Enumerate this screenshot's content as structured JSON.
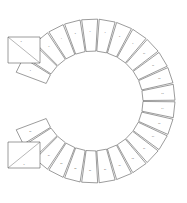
{
  "drawing": {
    "title": "C-Ring Segmented Assembly",
    "background_color": "#ffffff",
    "line_color": "#4a4a4a",
    "secondary_line_color": "#6e6e6e",
    "mark_color": "#6b6b6b",
    "canvas": {
      "width": 187,
      "height": 203
    }
  },
  "ring": {
    "center_x": 93,
    "center_y": 101,
    "inner_radius": 50,
    "outer_radius": 82,
    "segment_count": 26,
    "gap_opening_side": "left",
    "gap_start_angle_deg": 160,
    "gap_end_angle_deg": 200,
    "segments": [
      {
        "index": 1,
        "mark": "1",
        "start_deg": 200,
        "end_deg": 212.3
      },
      {
        "index": 2,
        "mark": "2",
        "start_deg": 212.3,
        "end_deg": 224.6
      },
      {
        "index": 3,
        "mark": "3",
        "start_deg": 224.6,
        "end_deg": 236.9
      },
      {
        "index": 4,
        "mark": "4",
        "start_deg": 236.9,
        "end_deg": 249.2
      },
      {
        "index": 5,
        "mark": "5",
        "start_deg": 249.2,
        "end_deg": 261.5
      },
      {
        "index": 6,
        "mark": "6",
        "start_deg": 261.5,
        "end_deg": 273.8
      },
      {
        "index": 7,
        "mark": "7",
        "start_deg": 273.8,
        "end_deg": 286.2
      },
      {
        "index": 8,
        "mark": "8",
        "start_deg": 286.2,
        "end_deg": 298.5
      },
      {
        "index": 9,
        "mark": "9",
        "start_deg": 298.5,
        "end_deg": 310.8
      },
      {
        "index": 10,
        "mark": "10",
        "start_deg": 310.8,
        "end_deg": 323.1
      },
      {
        "index": 11,
        "mark": "11",
        "start_deg": 323.1,
        "end_deg": 335.4
      },
      {
        "index": 12,
        "mark": "12",
        "start_deg": 335.4,
        "end_deg": 347.7
      },
      {
        "index": 13,
        "mark": "13",
        "start_deg": 347.7,
        "end_deg": 360
      },
      {
        "index": 14,
        "mark": "14",
        "start_deg": 0,
        "end_deg": 12.3
      },
      {
        "index": 15,
        "mark": "15",
        "start_deg": 12.3,
        "end_deg": 24.6
      },
      {
        "index": 16,
        "mark": "16",
        "start_deg": 24.6,
        "end_deg": 36.9
      },
      {
        "index": 17,
        "mark": "17",
        "start_deg": 36.9,
        "end_deg": 49.2
      },
      {
        "index": 18,
        "mark": "18",
        "start_deg": 49.2,
        "end_deg": 61.5
      },
      {
        "index": 19,
        "mark": "19",
        "start_deg": 61.5,
        "end_deg": 73.8
      },
      {
        "index": 20,
        "mark": "20",
        "start_deg": 73.8,
        "end_deg": 86.2
      },
      {
        "index": 21,
        "mark": "21",
        "start_deg": 86.2,
        "end_deg": 98.5
      },
      {
        "index": 22,
        "mark": "22",
        "start_deg": 98.5,
        "end_deg": 110.8
      },
      {
        "index": 23,
        "mark": "23",
        "start_deg": 110.8,
        "end_deg": 123.1
      },
      {
        "index": 24,
        "mark": "24",
        "start_deg": 123.1,
        "end_deg": 135.4
      },
      {
        "index": 25,
        "mark": "25",
        "start_deg": 135.4,
        "end_deg": 147.7
      },
      {
        "index": 26,
        "mark": "26",
        "start_deg": 147.7,
        "end_deg": 160
      }
    ]
  },
  "arms": [
    {
      "name": "upper-left-arm",
      "mark": "a",
      "points": "8,37 40,37 40,63 8,63",
      "diagonal": "8,37 40,63",
      "mark_x": 21,
      "mark_y": 41
    },
    {
      "name": "lower-left-arm",
      "mark": "b",
      "points": "8,142 40,142 40,168 8,168",
      "diagonal": "8,168 40,142",
      "mark_x": 24,
      "mark_y": 164
    }
  ]
}
